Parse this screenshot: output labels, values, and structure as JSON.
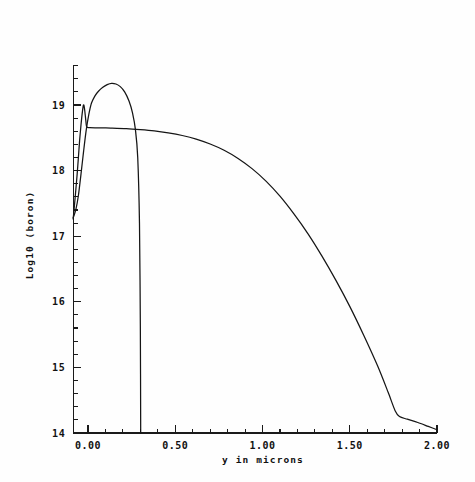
{
  "chart_data": {
    "type": "line",
    "title": "",
    "xlabel": "y in microns",
    "ylabel": "Log10 (boron)",
    "xlim": [
      -0.12,
      2.04
    ],
    "ylim": [
      14.0,
      19.6
    ],
    "xticks": [
      0.0,
      0.5,
      1.0,
      1.5,
      2.0
    ],
    "xtick_labels": [
      "0.00",
      "0.50",
      "1.00",
      "1.50",
      "2.00"
    ],
    "xminor_step": 0.1,
    "yticks": [
      14,
      15,
      16,
      17,
      18,
      19
    ],
    "ytick_labels": [
      "14",
      "15",
      "16",
      "17",
      "18",
      "19"
    ],
    "yminor_step": 0.2,
    "grid": false,
    "legend": "none",
    "series": [
      {
        "name": "implanted-profile",
        "comment": "narrow implant peak, abrupt cutoff at 0.30 um",
        "points": [
          [
            -0.085,
            17.28
          ],
          [
            -0.07,
            17.4
          ],
          [
            -0.055,
            17.62
          ],
          [
            -0.04,
            17.95
          ],
          [
            -0.025,
            18.3
          ],
          [
            -0.01,
            18.62
          ],
          [
            0.005,
            18.86
          ],
          [
            0.02,
            19.03
          ],
          [
            0.04,
            19.14
          ],
          [
            0.06,
            19.21
          ],
          [
            0.085,
            19.27
          ],
          [
            0.11,
            19.31
          ],
          [
            0.135,
            19.33
          ],
          [
            0.16,
            19.32
          ],
          [
            0.185,
            19.28
          ],
          [
            0.21,
            19.2
          ],
          [
            0.235,
            19.06
          ],
          [
            0.255,
            18.88
          ],
          [
            0.272,
            18.62
          ],
          [
            0.285,
            18.2
          ],
          [
            0.295,
            17.2
          ],
          [
            0.3,
            15.6
          ],
          [
            0.302,
            14.0
          ]
        ]
      },
      {
        "name": "diffused-profile",
        "comment": "surface spike to 19.0 then flat plateau 18.65 falling to 14.05",
        "points": [
          [
            -0.085,
            17.26
          ],
          [
            -0.078,
            17.46
          ],
          [
            -0.07,
            17.7
          ],
          [
            -0.062,
            17.95
          ],
          [
            -0.055,
            18.2
          ],
          [
            -0.048,
            18.46
          ],
          [
            -0.04,
            18.7
          ],
          [
            -0.032,
            18.9
          ],
          [
            -0.026,
            19.0
          ],
          [
            -0.022,
            18.98
          ],
          [
            -0.018,
            18.9
          ],
          [
            -0.014,
            18.8
          ],
          [
            -0.01,
            18.7
          ],
          [
            -0.006,
            18.66
          ],
          [
            0.01,
            18.655
          ],
          [
            0.06,
            18.652
          ],
          [
            0.13,
            18.648
          ],
          [
            0.22,
            18.64
          ],
          [
            0.3,
            18.625
          ],
          [
            0.38,
            18.605
          ],
          [
            0.46,
            18.575
          ],
          [
            0.54,
            18.535
          ],
          [
            0.62,
            18.48
          ],
          [
            0.7,
            18.405
          ],
          [
            0.78,
            18.31
          ],
          [
            0.86,
            18.185
          ],
          [
            0.94,
            18.03
          ],
          [
            1.02,
            17.84
          ],
          [
            1.1,
            17.61
          ],
          [
            1.18,
            17.34
          ],
          [
            1.26,
            17.04
          ],
          [
            1.34,
            16.7
          ],
          [
            1.42,
            16.33
          ],
          [
            1.5,
            15.93
          ],
          [
            1.58,
            15.49
          ],
          [
            1.66,
            15.02
          ],
          [
            1.72,
            14.62
          ],
          [
            1.76,
            14.34
          ],
          [
            1.785,
            14.25
          ],
          [
            1.83,
            14.21
          ],
          [
            1.89,
            14.16
          ],
          [
            1.95,
            14.1
          ],
          [
            2.0,
            14.05
          ]
        ]
      }
    ]
  },
  "axes": {
    "ylabel_text": "Log10 (boron)",
    "xlabel_text": "y in microns"
  }
}
